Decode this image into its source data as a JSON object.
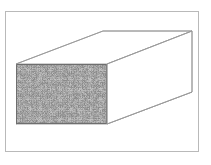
{
  "figure": {
    "title": "",
    "caption": "",
    "background_color": "#ffffff",
    "frame": {
      "name": "figure-border",
      "x": 5,
      "y": 11,
      "width": 194,
      "height": 141,
      "stroke_color": "#b9b9b9",
      "stroke_width": 1
    },
    "cuboid": {
      "name": "rectangular-prism",
      "edge_color": "#9a9a9a",
      "front_face_outline_color": "#6e6e6e",
      "back_face_fill": "#ffffff",
      "front_face": {
        "label": "textured-cross-section",
        "x1": 16,
        "y1": 64,
        "x2": 107,
        "y2": 124,
        "texture": "random-grayscale-noise",
        "texture_mean_gray": "#8a8a8a",
        "texture_dark": "#303030",
        "texture_light": "#d8d8d8"
      },
      "back_face": {
        "label": "rear-face",
        "x1": 103,
        "y1": 31,
        "x2": 192,
        "y2": 92
      },
      "depth_offset_x": 87,
      "depth_offset_y": -33
    }
  }
}
